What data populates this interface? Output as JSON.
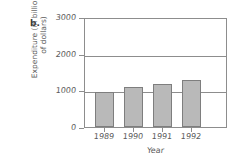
{
  "panel": {
    "label": "b."
  },
  "chart_data": {
    "type": "bar",
    "title": "",
    "subtitle": "",
    "panel_label": "b.",
    "categories": [
      "1989",
      "1990",
      "1991",
      "1992"
    ],
    "values": [
      960,
      1100,
      1180,
      1280
    ],
    "series": [
      {
        "name": "Expenditure",
        "values": [
          960,
          1100,
          1180,
          1280
        ]
      }
    ],
    "xlabel": "Year",
    "ylabel": "Expenditure (in billions\nof dollars)",
    "ylabel_lines": [
      "Expenditure (in billions",
      "of dollars)"
    ],
    "ytick_labels": [
      "0",
      "1000",
      "2000",
      "3000"
    ],
    "ytick_values": [
      0,
      1000,
      2000,
      3000
    ],
    "ylim": [
      0,
      3000
    ],
    "xtick_labels": [
      "1989",
      "1990",
      "1991",
      "1992"
    ],
    "grid": true,
    "grid_axis": "y",
    "legend": false,
    "legend_position": "none",
    "bar_color": "#b9b9b9",
    "bar_edge_color": "#7e7e7e",
    "axis_color": "#8d8d8d",
    "text_color": "#5a5a5a",
    "background": "#ffffff"
  }
}
